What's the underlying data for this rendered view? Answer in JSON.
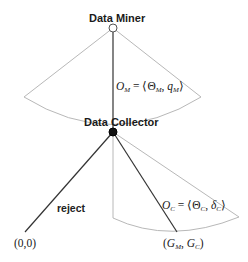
{
  "diagram": {
    "type": "game-tree",
    "colors": {
      "edge": "#333333",
      "fan": "#b8b8b8",
      "root_node_fill": "#ffffff",
      "collector_node_fill": "#111111"
    },
    "nodes": {
      "root": {
        "label": "Data Miner",
        "x": 113,
        "y": 28
      },
      "collector": {
        "label": "Data Collector",
        "x": 113,
        "y": 132
      },
      "leaf_reject": {
        "label": "(0,0)",
        "x": 25,
        "y": 232
      },
      "leaf_accept": {
        "label": "(G_M, G_C)",
        "x": 177,
        "y": 232
      }
    },
    "edges": {
      "miner_offer": {
        "from": "root",
        "to": "collector",
        "label_parts": {
          "O": "O",
          "O_sub": "M",
          "eq": " = ⟨",
          "Theta": "Θ",
          "Theta_sub": "M",
          "comma": ", ",
          "q": "q",
          "q_sub": "M",
          "close": "⟩"
        }
      },
      "reject": {
        "from": "collector",
        "to": "leaf_reject",
        "label": "reject"
      },
      "collector_offer": {
        "from": "collector",
        "to": "leaf_accept",
        "label_parts": {
          "O": "O",
          "O_sub": "C",
          "eq": " = ⟨",
          "Theta": "Θ",
          "Theta_sub": "C",
          "comma": ", ",
          "delta": "δ",
          "delta_sub": "C",
          "close": "⟩"
        }
      }
    },
    "leaf_labels": {
      "reject": "(0,0)",
      "accept_parts": {
        "open": "(",
        "G1": "G",
        "G1_sub": "M",
        "comma": ", ",
        "G2": "G",
        "G2_sub": "C",
        "close": ")"
      }
    }
  }
}
